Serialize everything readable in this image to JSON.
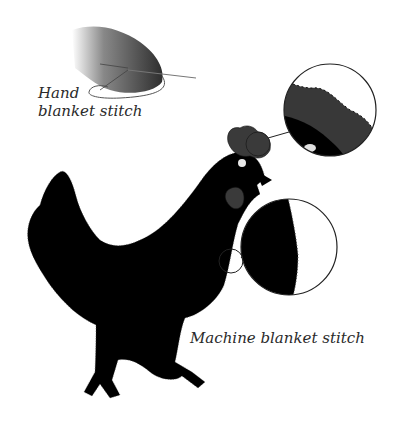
{
  "labels": {
    "hand_line1": "Hand",
    "hand_line2": "blanket stitch",
    "machine": "Machine blanket stitch"
  },
  "colors": {
    "silhouette": "#000000",
    "felt_grey": "#3a3a3a",
    "outline": "#222222",
    "background": "#ffffff"
  },
  "callouts": [
    {
      "name": "comb-detail",
      "description": "magnified comb edge with hand blanket stitch"
    },
    {
      "name": "breast-detail",
      "description": "magnified breast edge with machine blanket stitch"
    }
  ]
}
